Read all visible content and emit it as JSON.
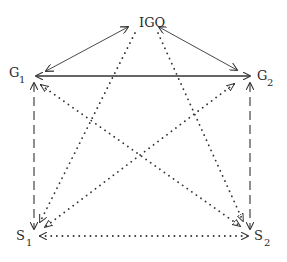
{
  "diagram": {
    "type": "network",
    "colors": {
      "line": "#333333",
      "text": "#2a2a2a",
      "background": "#ffffff"
    },
    "nodes": [
      {
        "id": "IGO",
        "label": "IGO",
        "subscript": ""
      },
      {
        "id": "G1",
        "label": "G",
        "subscript": "1"
      },
      {
        "id": "G2",
        "label": "G",
        "subscript": "2"
      },
      {
        "id": "S1",
        "label": "S",
        "subscript": "1"
      },
      {
        "id": "S2",
        "label": "S",
        "subscript": "2"
      }
    ],
    "edges": [
      {
        "from": "IGO",
        "to": "G1",
        "style": "solid",
        "direction": "both"
      },
      {
        "from": "IGO",
        "to": "G2",
        "style": "solid",
        "direction": "both"
      },
      {
        "from": "G1",
        "to": "G2",
        "style": "solid-bold",
        "direction": "both"
      },
      {
        "from": "G1",
        "to": "S1",
        "style": "dashed",
        "direction": "both"
      },
      {
        "from": "G2",
        "to": "S2",
        "style": "dashed",
        "direction": "both"
      },
      {
        "from": "IGO",
        "to": "S1",
        "style": "dotted",
        "direction": "forward"
      },
      {
        "from": "IGO",
        "to": "S2",
        "style": "dotted",
        "direction": "forward"
      },
      {
        "from": "G1",
        "to": "S2",
        "style": "dotted",
        "direction": "both"
      },
      {
        "from": "G2",
        "to": "S1",
        "style": "dotted",
        "direction": "both"
      },
      {
        "from": "S1",
        "to": "S2",
        "style": "dotted",
        "direction": "both"
      }
    ]
  }
}
